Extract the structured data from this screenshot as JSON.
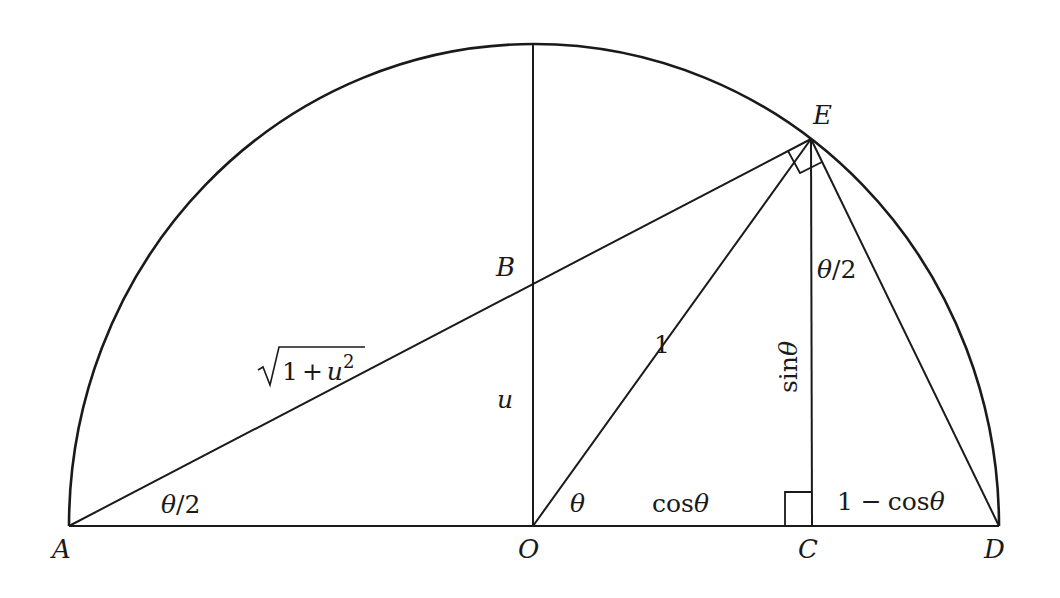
{
  "diagram": {
    "type": "geometry",
    "points": {
      "A": {
        "label": "A",
        "x": 69,
        "y": 526
      },
      "O": {
        "label": "O",
        "x": 533,
        "y": 526
      },
      "C": {
        "label": "C",
        "x": 813,
        "y": 526
      },
      "D": {
        "label": "D",
        "x": 999,
        "y": 526
      },
      "E": {
        "label": "E",
        "x": 811,
        "y": 139
      },
      "B": {
        "label": "B",
        "x": 533,
        "y": 283
      },
      "Top": {
        "x": 533,
        "y": 44
      }
    },
    "segment_labels": {
      "AE": "√(1+u²)",
      "OB": "u",
      "OE": "1",
      "CE": "sinθ",
      "OC": "cosθ",
      "CD": "1 − cosθ"
    },
    "angle_labels": {
      "at_A": "θ/2",
      "at_O": "θ",
      "at_E_CED": "θ/2"
    },
    "text": {
      "sqrt_radicand_1": "1",
      "sqrt_plus": "+",
      "sqrt_u": "u",
      "sqrt_exp": "2",
      "one": "1",
      "u": "u",
      "sin": "sin",
      "cos1": "cos",
      "cos2": "cos",
      "one_minus": "1 −",
      "theta": "θ",
      "half_theta_1": "θ/2",
      "half_theta_2": "θ/2"
    },
    "colors": {
      "stroke": "#1a1a1a",
      "background": "#ffffff"
    }
  }
}
